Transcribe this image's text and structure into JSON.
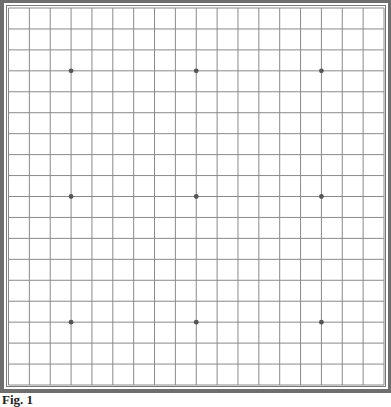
{
  "figure": {
    "caption": "Fig. 1",
    "grid_lines": 19,
    "star_points": [
      {
        "col": 4,
        "row": 4
      },
      {
        "col": 10,
        "row": 4
      },
      {
        "col": 16,
        "row": 4
      },
      {
        "col": 4,
        "row": 10
      },
      {
        "col": 10,
        "row": 10
      },
      {
        "col": 16,
        "row": 10
      },
      {
        "col": 4,
        "row": 16
      },
      {
        "col": 10,
        "row": 16
      },
      {
        "col": 16,
        "row": 16
      }
    ],
    "colors": {
      "frame": "#6e6e6e",
      "grid_line": "#8a8a8a",
      "star_point": "#555555",
      "board": "#ffffff"
    }
  }
}
